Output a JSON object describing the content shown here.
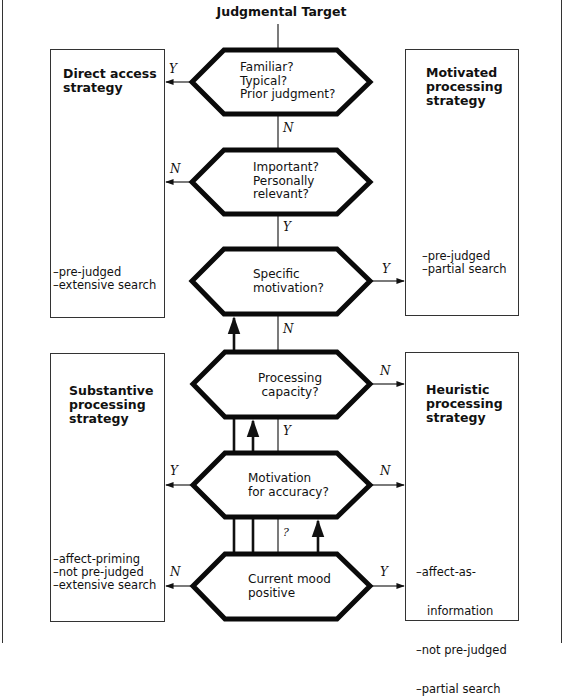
{
  "title": "Judgmental Target",
  "boxes": {
    "direct_access": {
      "title_lines": [
        "Direct access",
        "strategy"
      ],
      "notes": [
        "–pre-judged",
        "–extensive search"
      ]
    },
    "motivated": {
      "title_lines": [
        "Motivated",
        "processing",
        "strategy"
      ],
      "notes": [
        "–pre-judged",
        "–partial search"
      ]
    },
    "substantive": {
      "title_lines": [
        "Substantive",
        "processing",
        "strategy"
      ],
      "notes": [
        "–affect-priming",
        "–not pre-judged",
        "–extensive search"
      ]
    },
    "heuristic": {
      "title_lines": [
        "Heuristic",
        "processing",
        "strategy"
      ],
      "notes": [
        "–affect-as-",
        "   information",
        "–not pre-judged",
        "–partial search"
      ]
    }
  },
  "decisions": [
    {
      "lines": [
        "Familiar?",
        "Typical?",
        "Prior judgment?"
      ]
    },
    {
      "lines": [
        "Important?",
        "Personally",
        "relevant?"
      ]
    },
    {
      "lines": [
        "Specific",
        "motivation?"
      ]
    },
    {
      "lines": [
        "Processing",
        "capacity?"
      ]
    },
    {
      "lines": [
        "Motivation",
        "for accuracy?"
      ]
    },
    {
      "lines": [
        "Current mood",
        "positive"
      ]
    }
  ],
  "edge_labels": {
    "d1_left": "Y",
    "d1_down": "N",
    "d2_left": "N",
    "d2_down": "Y",
    "d3_right": "Y",
    "d3_down": "N",
    "d4_right": "N",
    "d4_down": "Y",
    "d5_left": "Y",
    "d5_right": "N",
    "d6_up": "?",
    "d6_left": "N",
    "d6_right": "Y"
  }
}
